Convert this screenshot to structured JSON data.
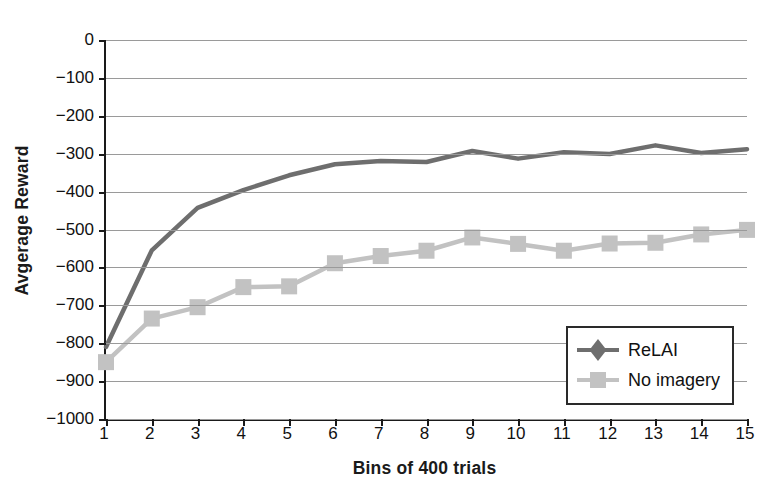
{
  "chart_data": {
    "type": "line",
    "title": "",
    "xlabel": "Bins of 400 trials",
    "ylabel": "Avgerage Reward",
    "x": [
      1,
      2,
      3,
      4,
      5,
      6,
      7,
      8,
      9,
      10,
      11,
      12,
      13,
      14,
      15
    ],
    "xtick_labels": [
      "1",
      "2",
      "3",
      "4",
      "5",
      "6",
      "7",
      "8",
      "9",
      "10",
      "11",
      "12",
      "13",
      "14",
      "15"
    ],
    "ytick_labels": [
      "0",
      "−100",
      "−200",
      "−300",
      "−400",
      "−500",
      "−600",
      "−700",
      "−800",
      "−900",
      "−1000"
    ],
    "ytick_values": [
      0,
      -100,
      -200,
      -300,
      -400,
      -500,
      -600,
      -700,
      -800,
      -900,
      -1000
    ],
    "ylim": [
      -1000,
      0
    ],
    "xlim": [
      1,
      15
    ],
    "grid": true,
    "legend_position": "lower right",
    "series": [
      {
        "name": "ReLAI",
        "color": "#6e6e6e",
        "marker": "diamond",
        "values": [
          -810,
          -555,
          -443,
          -396,
          -357,
          -328,
          -319,
          -322,
          -293,
          -313,
          -296,
          -301,
          -278,
          -298,
          -288
        ]
      },
      {
        "name": "No imagery",
        "color": "#c2c2c2",
        "marker": "square",
        "values": [
          -850,
          -735,
          -705,
          -652,
          -650,
          -589,
          -570,
          -556,
          -521,
          -538,
          -556,
          -537,
          -535,
          -513,
          -501
        ]
      }
    ]
  },
  "legend": {
    "items": [
      {
        "label": "ReLAI"
      },
      {
        "label": "No imagery"
      }
    ]
  }
}
